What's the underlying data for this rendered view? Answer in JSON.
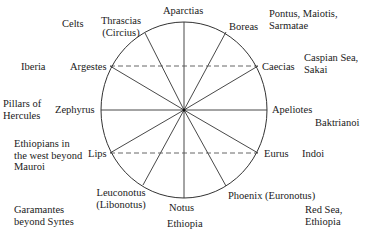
{
  "diagram": {
    "type": "wind-rose",
    "center": {
      "x": 184,
      "y": 110
    },
    "radius": {
      "rx": 83,
      "ry": 88
    },
    "stroke_color": "#333333",
    "winds": [
      {
        "id": "aparctias",
        "name": "Aparctias",
        "end": [
          184,
          22
        ]
      },
      {
        "id": "boreas",
        "name": "Boreas",
        "end": [
          226,
          32
        ]
      },
      {
        "id": "caecias",
        "name": "Caecias",
        "end": [
          258,
          66
        ]
      },
      {
        "id": "apeliotes",
        "name": "Apeliotes",
        "end": [
          267,
          110
        ]
      },
      {
        "id": "eurus",
        "name": "Eurus",
        "end": [
          258,
          153
        ]
      },
      {
        "id": "phoenix",
        "name": "Phoenix (Euronotus)",
        "end": [
          226,
          186
        ]
      },
      {
        "id": "notus",
        "name": "Notus",
        "end": [
          184,
          198
        ]
      },
      {
        "id": "leuconotus",
        "name": "Leuconotus\n(Libonotus)",
        "end": [
          143,
          185
        ]
      },
      {
        "id": "lips",
        "name": "Lips",
        "end": [
          110,
          153
        ]
      },
      {
        "id": "zephyrus",
        "name": "Zephyrus",
        "end": [
          101,
          110
        ]
      },
      {
        "id": "argestes",
        "name": "Argestes",
        "end": [
          110,
          66
        ]
      },
      {
        "id": "thrascias",
        "name": "Thrascias\n(Circius)",
        "end": [
          145,
          33
        ]
      }
    ],
    "dashed_lines": [
      {
        "from": "argestes",
        "to": "caecias",
        "y": 66
      },
      {
        "from": "lips",
        "to": "eurus",
        "y": 153
      }
    ],
    "regions": [
      {
        "id": "celts",
        "name": "Celts"
      },
      {
        "id": "iberia",
        "name": "Iberia"
      },
      {
        "id": "pillars",
        "name": "Pillars of\nHercules"
      },
      {
        "id": "ethiopians-west",
        "name": "Ethiopians in\nthe west beyond\nMauroi"
      },
      {
        "id": "garamantes",
        "name": "Garamantes\nbeyond Syrtes"
      },
      {
        "id": "ethiopia",
        "name": "Ethiopia"
      },
      {
        "id": "red-sea",
        "name": "Red Sea,\nEthiopia"
      },
      {
        "id": "indoi",
        "name": "Indoi"
      },
      {
        "id": "baktrianoi",
        "name": "Baktrianoi"
      },
      {
        "id": "caspian",
        "name": "Caspian Sea,\nSakai"
      },
      {
        "id": "pontus",
        "name": "Pontus, Maiotis,\nSarmatae"
      }
    ]
  }
}
